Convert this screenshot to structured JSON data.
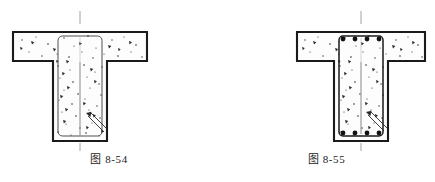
{
  "sheet": {
    "title": "T-shaped reinforced concrete beam cross-sections",
    "background_color": "#ffffff",
    "ink_color": "#1a1a1a",
    "hatch_color": "#404040",
    "centerline_color": "#8c8c8c"
  },
  "figures": [
    {
      "id": "fig-8-54",
      "caption_cjk": "图",
      "caption_number": "8-54",
      "caption_full": "图 8-54",
      "description": "T-beam cross-section with closed rectangular stirrup shown, no longitudinal bar dots",
      "stirrup_visible": true,
      "rebar_dots_visible": false,
      "leader_line": "diagonal-hatched-leader-lower-right",
      "centerline_visible": true,
      "geometry": {
        "flange_left_x": 13,
        "flange_right_x": 147,
        "flange_top_y": 32,
        "flange_bottom_y": 61,
        "web_left_x": 53,
        "web_right_x": 107,
        "web_bottom_y": 141,
        "centerline_x": 80
      }
    },
    {
      "id": "fig-8-55",
      "caption_cjk": "图",
      "caption_number": "8-55",
      "caption_full": "图 8-55",
      "description": "T-beam cross-section with closed stirrup and four top plus four bottom longitudinal bar dots",
      "stirrup_visible": true,
      "rebar_dots_visible": true,
      "rebar_top_count": 4,
      "rebar_bottom_count": 4,
      "leader_line": "diagonal-hatched-leader-lower-right",
      "centerline_visible": true,
      "geometry": {
        "flange_left_x": 297,
        "flange_right_x": 425,
        "flange_top_y": 32,
        "flange_bottom_y": 61,
        "web_left_x": 334,
        "web_right_x": 388,
        "web_bottom_y": 141,
        "centerline_x": 361
      }
    }
  ]
}
